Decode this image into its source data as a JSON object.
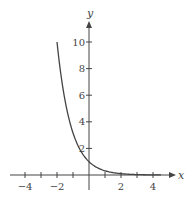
{
  "chart_data": {
    "type": "line",
    "title": "",
    "xlabel": "x",
    "ylabel": "y",
    "xlim": [
      -5,
      5
    ],
    "ylim": [
      0,
      11
    ],
    "x_ticks": [
      -4,
      -3,
      -2,
      -1,
      1,
      2,
      3,
      4
    ],
    "x_tick_labels": [
      "-4",
      "-2",
      "2",
      "4"
    ],
    "x_labeled_ticks": [
      -4,
      -2,
      2,
      4
    ],
    "y_ticks": [
      2,
      4,
      6,
      8,
      10
    ],
    "y_tick_labels": [
      "2",
      "4",
      "6",
      "8",
      "10"
    ],
    "grid": false,
    "legend": null,
    "series": [
      {
        "name": "y = 10^(-x/2)",
        "x": [
          -2,
          -1.5,
          -1,
          -0.5,
          0,
          0.5,
          1,
          1.5,
          2,
          2.5,
          3,
          3.5,
          4,
          4.5
        ],
        "y": [
          10,
          5.62,
          3.16,
          1.78,
          1,
          0.56,
          0.32,
          0.18,
          0.1,
          0.06,
          0.03,
          0.02,
          0.01,
          0.01
        ]
      }
    ],
    "color": "#444444"
  }
}
